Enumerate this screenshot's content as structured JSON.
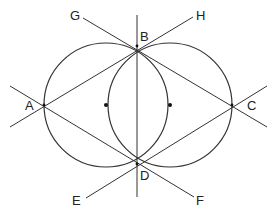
{
  "diagram": {
    "stroke_color": "#333333",
    "circles": [
      {
        "name": "left-circle",
        "cx": 106,
        "cy": 105,
        "r": 62
      },
      {
        "name": "right-circle",
        "cx": 170,
        "cy": 105,
        "r": 62
      }
    ],
    "centers": [
      {
        "name": "left-center",
        "x": 106,
        "y": 105
      },
      {
        "name": "right-center",
        "x": 170,
        "y": 105
      }
    ],
    "points": {
      "A": {
        "x": 44,
        "y": 105
      },
      "B": {
        "x": 137,
        "y": 46
      },
      "C": {
        "x": 232,
        "y": 105
      },
      "D": {
        "x": 137,
        "y": 164
      }
    },
    "lines": [
      {
        "name": "line-G-C",
        "x1": 83,
        "y1": 18,
        "x2": 267,
        "y2": 127
      },
      {
        "name": "line-H-A",
        "x1": 193,
        "y1": 17,
        "x2": 10,
        "y2": 127
      },
      {
        "name": "line-E-C",
        "x1": 86,
        "y1": 198,
        "x2": 267,
        "y2": 86
      },
      {
        "name": "line-F-A",
        "x1": 194,
        "y1": 197,
        "x2": 10,
        "y2": 86
      },
      {
        "name": "line-vertical-BD",
        "x1": 137,
        "y1": 15,
        "x2": 137,
        "y2": 197
      }
    ],
    "labels": {
      "A": "A",
      "B": "B",
      "C": "C",
      "D": "D",
      "E": "E",
      "F": "F",
      "G": "G",
      "H": "H"
    }
  }
}
